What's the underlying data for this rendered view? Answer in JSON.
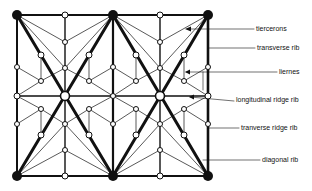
{
  "diagram": {
    "type": "vault rib plan",
    "labels": [
      {
        "id": "tiercerons",
        "text": "tiercerons",
        "x": 256,
        "y": 25,
        "lineFrom": [
          208,
          29
        ],
        "lineTo": [
          254,
          29
        ]
      },
      {
        "id": "transverse-rib",
        "text": "transverse rib",
        "x": 257,
        "y": 44,
        "lineFrom": [
          211,
          48
        ],
        "lineTo": [
          255,
          48
        ]
      },
      {
        "id": "liernes",
        "text": "liernes",
        "x": 279,
        "y": 68,
        "lineFrom": [
          209,
          72
        ],
        "lineTo": [
          277,
          72
        ]
      },
      {
        "id": "longitudinal-ridge-rib",
        "text": "longitudinal ridge rib",
        "x": 236,
        "y": 97,
        "lineFrom": [
          208,
          101
        ],
        "lineTo": [
          234,
          101
        ]
      },
      {
        "id": "tranverse-ridge-rib",
        "text": "tranverse ridge rib",
        "x": 241,
        "y": 124,
        "lineFrom": [
          209,
          128
        ],
        "lineTo": [
          239,
          128
        ]
      },
      {
        "id": "diagonal-rib",
        "text": "diagonal rib",
        "x": 262,
        "y": 159,
        "lineFrom": [
          203,
          160
        ],
        "lineTo": [
          260,
          160
        ]
      }
    ]
  }
}
